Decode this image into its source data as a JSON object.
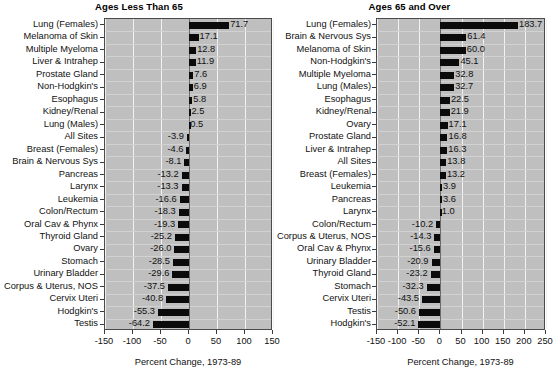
{
  "chart_data": [
    {
      "type": "bar",
      "title": "Ages Less Than 65",
      "xlabel": "Percent Change, 1973-89",
      "ylabel": "",
      "orientation": "horizontal",
      "xlim": [
        -150,
        150
      ],
      "xticks": [
        -150,
        -100,
        -50,
        0,
        50,
        100,
        150
      ],
      "grid": true,
      "legend": "none",
      "categories": [
        "Lung (Females)",
        "Melanoma of Skin",
        "Multiple Myeloma",
        "Liver & Intrahep",
        "Prostate Gland",
        "Non-Hodgkin's",
        "Esophagus",
        "Kidney/Renal",
        "Lung (Males)",
        "All Sites",
        "Breast (Females)",
        "Brain & Nervous Sys",
        "Pancreas",
        "Larynx",
        "Leukemia",
        "Colon/Rectum",
        "Oral Cav & Phynx",
        "Thyroid Gland",
        "Ovary",
        "Stomach",
        "Urinary Bladder",
        "Corpus & Uterus, NOS",
        "Cervix Uteri",
        "Hodgkin's",
        "Testis"
      ],
      "values": [
        71.7,
        17.1,
        12.8,
        11.9,
        7.6,
        6.9,
        5.8,
        2.5,
        0.5,
        -3.9,
        -4.6,
        -8.1,
        -13.2,
        -13.3,
        -16.6,
        -18.3,
        -19.3,
        -25.2,
        -26.0,
        -28.5,
        -29.6,
        -37.5,
        -40.8,
        -55.3,
        -64.2
      ],
      "value_labels": [
        "71.7",
        "17.1",
        "12.8",
        "11.9",
        "7.6",
        "6.9",
        "5.8",
        "2.5",
        "0.5",
        "-3.9",
        "-4.6",
        "-8.1",
        "-13.2",
        "-13.3",
        "-16.6",
        "-18.3",
        "-19.3",
        "-25.2",
        "-26.0",
        "-28.5",
        "-29.6",
        "-37.5",
        "-40.8",
        "-55.3",
        "-64.2"
      ]
    },
    {
      "type": "bar",
      "title": "Ages 65 and Over",
      "xlabel": "Percent Change, 1973-89",
      "ylabel": "",
      "orientation": "horizontal",
      "xlim": [
        -150,
        250
      ],
      "xticks": [
        -150,
        -100,
        -50,
        0,
        50,
        100,
        150,
        200,
        250
      ],
      "grid": true,
      "legend": "none",
      "categories": [
        "Lung (Females)",
        "Brain & Nervous Sys",
        "Melanoma of Skin",
        "Non-Hodgkin's",
        "Multiple Myeloma",
        "Lung (Males)",
        "Esophagus",
        "Kidney/Renal",
        "Ovary",
        "Prostate Gland",
        "Liver & Intrahep",
        "All Sites",
        "Breast (Females)",
        "Leukemia",
        "Pancreas",
        "Larynx",
        "Colon/Rectum",
        "Corpus & Uterus, NOS",
        "Oral Cav & Phynx",
        "Urinary Bladder",
        "Thyroid Gland",
        "Stomach",
        "Cervix Uteri",
        "Testis",
        "Hodgkin's"
      ],
      "values": [
        183.7,
        61.4,
        60.0,
        45.1,
        32.8,
        32.7,
        22.5,
        21.9,
        17.1,
        16.8,
        16.3,
        13.8,
        13.2,
        3.9,
        3.6,
        1.0,
        -10.2,
        -14.3,
        -15.6,
        -20.9,
        -23.2,
        -32.3,
        -43.5,
        -50.6,
        -52.1
      ],
      "value_labels": [
        "183.7",
        "61.4",
        "60.0",
        "45.1",
        "32.8",
        "32.7",
        "22.5",
        "21.9",
        "17.1",
        "16.8",
        "16.3",
        "13.8",
        "13.2",
        "3.9",
        "3.6",
        "1.0",
        "-10.2",
        "-14.3",
        "-15.6",
        "-20.9",
        "-23.2",
        "-32.3",
        "-43.5",
        "-50.6",
        "-52.1"
      ]
    }
  ],
  "colors": {
    "bar": "#0b0b0b",
    "plot_background": "#bfbfbf",
    "gridline": "#f2f2f2",
    "page_background": "#ffffff",
    "text": "#111111"
  }
}
